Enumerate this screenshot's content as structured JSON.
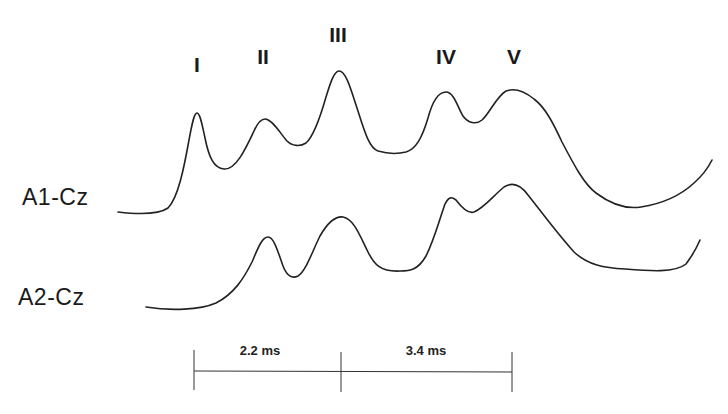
{
  "figure": {
    "type": "auditory brainstem response waveforms",
    "peak_labels": [
      {
        "label": "I",
        "x": 197,
        "y": 72
      },
      {
        "label": "II",
        "x": 263,
        "y": 64
      },
      {
        "label": "III",
        "x": 338,
        "y": 42
      },
      {
        "label": "IV",
        "x": 446,
        "y": 64
      },
      {
        "label": "V",
        "x": 514,
        "y": 64
      }
    ],
    "channels": [
      {
        "label": "A1-Cz",
        "x": 22,
        "y": 205
      },
      {
        "label": "A2-Cz",
        "x": 18,
        "y": 305
      }
    ],
    "intervals": [
      {
        "label": "2.2 ms",
        "from_peak": "I",
        "to_peak": "III"
      },
      {
        "label": "3.4 ms",
        "from_peak": "III",
        "to_peak": "V"
      }
    ],
    "scale_bar": {
      "y": 371,
      "ticks_x": [
        194,
        341,
        512
      ],
      "tick_top": 350,
      "tick_bottom": 392
    }
  },
  "colors": {
    "background": "#ffffff",
    "trace": "#222222",
    "text": "#1a1a1a"
  }
}
